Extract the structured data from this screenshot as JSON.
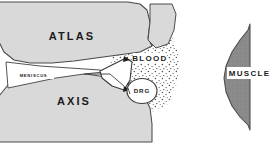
{
  "figure": {
    "name": "atlanto-axial-joint-and-muscle-diagram",
    "type": "anatomical-line-diagram",
    "background_color": "#ffffff",
    "panels": [
      {
        "id": "joint-panel",
        "name": "atlanto-axial-joint-panel",
        "position": "left"
      },
      {
        "id": "muscle-panel",
        "name": "muscle-panel",
        "position": "right"
      }
    ]
  },
  "colors": {
    "bone_fill": "#d9d9d9",
    "bone_stroke": "#4a4a4a",
    "muscle_fill": "#8a8a8a",
    "muscle_stroke": "#4a4a4a",
    "stipple": "#5a5a5a",
    "label_text": "#1b1b1b",
    "label_box": "#ffffff",
    "background": "#ffffff"
  },
  "labels": {
    "atlas": "ATLAS",
    "axis": "AXIS",
    "meniscus": "MENISCUS",
    "blood": "BLOOD",
    "drg": "DRG",
    "muscle": "MUSCLE"
  },
  "structures": [
    {
      "key": "atlas",
      "label": "ATLAS",
      "kind": "bone",
      "fill": "#d9d9d9",
      "panel": "joint-panel"
    },
    {
      "key": "axis",
      "label": "AXIS",
      "kind": "bone",
      "fill": "#d9d9d9",
      "panel": "joint-panel"
    },
    {
      "key": "meniscus",
      "label": "MENISCUS",
      "kind": "fibrocartilage-wedge",
      "fill": "#ffffff",
      "panel": "joint-panel"
    },
    {
      "key": "blood",
      "label": "BLOOD",
      "kind": "stippled-vascular-region",
      "fill": "stipple",
      "panel": "joint-panel"
    },
    {
      "key": "drg",
      "label": "DRG",
      "kind": "dorsal-root-ganglion",
      "fill": "#ffffff",
      "panel": "joint-panel"
    },
    {
      "key": "muscle",
      "label": "MUSCLE",
      "kind": "muscle-belly",
      "fill": "#8a8a8a",
      "panel": "muscle-panel"
    }
  ]
}
